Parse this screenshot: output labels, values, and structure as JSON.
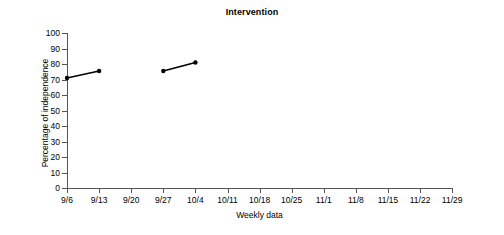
{
  "chart_data": {
    "type": "line",
    "title": "Intervention",
    "xlabel": "Weekly data",
    "ylabel": "Percentage of independence",
    "x_tick_labels": [
      "9/6",
      "9/13",
      "9/20",
      "9/27",
      "10/4",
      "10/11",
      "10/18",
      "10/25",
      "11/1",
      "11/8",
      "11/15",
      "11/22",
      "11/29"
    ],
    "y_tick_labels": [
      "0",
      "10",
      "20",
      "30",
      "40",
      "50",
      "60",
      "70",
      "80",
      "90",
      "100"
    ],
    "y_ticks": [
      0,
      10,
      20,
      30,
      40,
      50,
      60,
      70,
      80,
      90,
      100
    ],
    "ylim": [
      0,
      100
    ],
    "xlim": [
      0,
      12
    ],
    "grid": false,
    "legend": false,
    "line_color": "#000000",
    "marker": "circle",
    "marker_color": "#000000",
    "series": [
      {
        "name": "segment-1",
        "points": [
          {
            "x": "9/6",
            "x_index": 0,
            "y": 71
          },
          {
            "x": "9/13",
            "x_index": 1,
            "y": 75.5
          }
        ]
      },
      {
        "name": "segment-2",
        "points": [
          {
            "x": "9/27",
            "x_index": 3,
            "y": 75.5
          },
          {
            "x": "10/4",
            "x_index": 4,
            "y": 81
          }
        ]
      }
    ]
  }
}
